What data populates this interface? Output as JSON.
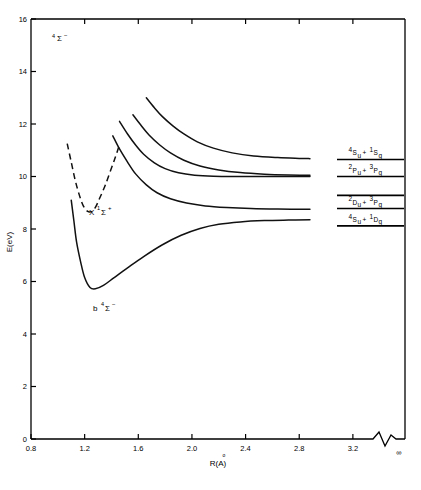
{
  "figure": {
    "state_label": "4Σ−",
    "state_label_sup": "4",
    "state_label_main": "Σ",
    "state_label_charge": "−"
  },
  "axes": {
    "y_title": "E(eV)",
    "x_title_main": "R(A)",
    "x_title_ring": "o",
    "x_title_display": "R(Å)",
    "y_ticks": [
      "0",
      "2",
      "4",
      "6",
      "8",
      "10",
      "12",
      "14",
      "16"
    ],
    "y_values": [
      0,
      2,
      4,
      6,
      8,
      10,
      12,
      14,
      16
    ],
    "x_ticks": [
      "0.8",
      "1.2",
      "1.6",
      "2.0",
      "2.4",
      "2.8",
      "3.2"
    ],
    "x_values": [
      0.8,
      1.2,
      1.6,
      2.0,
      2.4,
      2.8,
      3.2
    ],
    "x_infinity": "∞",
    "ylim": [
      0,
      16
    ],
    "xlim": [
      0.8,
      3.35
    ],
    "grid": false,
    "break_present": true
  },
  "curve_labels": {
    "ground": {
      "prefix": "X",
      "sup": "1",
      "term": "Σ",
      "charge": "+",
      "full": "X 1Σ+"
    },
    "quartet": {
      "prefix": "b",
      "sup": "4",
      "term": "Σ",
      "charge": "−",
      "full": "b 4Σ−"
    }
  },
  "dissociation_limits": [
    {
      "id": "limit-1",
      "energy": 10.65,
      "left": "4",
      "left_term": "S",
      "left_sub": "u",
      "right": "1",
      "right_term": "S",
      "right_sub": "g",
      "text": "4Su + 1Sg"
    },
    {
      "id": "limit-2",
      "energy": 10.0,
      "left": "2",
      "left_term": "P",
      "left_sub": "u",
      "right": "3",
      "right_term": "P",
      "right_sub": "g",
      "text": "2Pu + 3Pg"
    },
    {
      "id": "limit-3",
      "energy": 9.28,
      "left": "",
      "left_term": "",
      "left_sub": "",
      "right": "",
      "right_term": "",
      "right_sub": "",
      "text": ""
    },
    {
      "id": "limit-4",
      "energy": 8.78,
      "left": "2",
      "left_term": "D",
      "left_sub": "u",
      "right": "3",
      "right_term": "P",
      "right_sub": "g",
      "text": "2Du + 3Pg"
    },
    {
      "id": "limit-5",
      "energy": 8.12,
      "left": "4",
      "left_term": "S",
      "left_sub": "u",
      "right": "1",
      "right_term": "D",
      "right_sub": "g",
      "text": "4Su + 1Dg"
    }
  ],
  "chart_data": {
    "type": "line",
    "title": "",
    "xlabel": "R(Å)",
    "ylabel": "E(eV)",
    "xlim": [
      0.8,
      3.35
    ],
    "ylim": [
      0,
      16
    ],
    "grid": false,
    "legend": "none",
    "series": [
      {
        "name": "X 1Σ+",
        "style": "dashed",
        "label": "X 1Σ+",
        "points": [
          [
            1.07,
            11.25
          ],
          [
            1.1,
            10.55
          ],
          [
            1.13,
            9.85
          ],
          [
            1.16,
            9.3
          ],
          [
            1.19,
            8.88
          ],
          [
            1.22,
            8.68
          ],
          [
            1.25,
            8.66
          ],
          [
            1.28,
            8.82
          ],
          [
            1.31,
            9.15
          ],
          [
            1.35,
            9.62
          ],
          [
            1.39,
            10.18
          ],
          [
            1.43,
            10.75
          ],
          [
            1.46,
            11.22
          ]
        ]
      },
      {
        "name": "b 4Σ−",
        "style": "solid",
        "label": "b 4Σ−",
        "points": [
          [
            1.1,
            9.1
          ],
          [
            1.12,
            8.3
          ],
          [
            1.14,
            7.5
          ],
          [
            1.17,
            6.75
          ],
          [
            1.2,
            6.15
          ],
          [
            1.24,
            5.77
          ],
          [
            1.28,
            5.72
          ],
          [
            1.34,
            5.85
          ],
          [
            1.42,
            6.15
          ],
          [
            1.52,
            6.52
          ],
          [
            1.64,
            6.95
          ],
          [
            1.78,
            7.4
          ],
          [
            1.92,
            7.76
          ],
          [
            2.06,
            8.02
          ],
          [
            2.2,
            8.18
          ],
          [
            2.36,
            8.27
          ],
          [
            2.54,
            8.32
          ],
          [
            2.72,
            8.34
          ],
          [
            2.88,
            8.35
          ]
        ]
      },
      {
        "name": "repulsive-1",
        "style": "solid",
        "asymptote": 8.75,
        "points": [
          [
            1.41,
            11.55
          ],
          [
            1.46,
            11.05
          ],
          [
            1.52,
            10.55
          ],
          [
            1.58,
            10.1
          ],
          [
            1.66,
            9.68
          ],
          [
            1.74,
            9.38
          ],
          [
            1.84,
            9.15
          ],
          [
            1.96,
            8.99
          ],
          [
            2.1,
            8.88
          ],
          [
            2.26,
            8.82
          ],
          [
            2.44,
            8.78
          ],
          [
            2.64,
            8.76
          ],
          [
            2.88,
            8.75
          ]
        ]
      },
      {
        "name": "repulsive-2",
        "style": "solid",
        "asymptote": 10.0,
        "points": [
          [
            1.46,
            12.1
          ],
          [
            1.52,
            11.62
          ],
          [
            1.58,
            11.2
          ],
          [
            1.64,
            10.85
          ],
          [
            1.72,
            10.52
          ],
          [
            1.8,
            10.3
          ],
          [
            1.9,
            10.14
          ],
          [
            2.02,
            10.05
          ],
          [
            2.16,
            10.01
          ],
          [
            2.34,
            10.0
          ],
          [
            2.54,
            10.0
          ],
          [
            2.74,
            10.0
          ],
          [
            2.88,
            10.0
          ]
        ]
      },
      {
        "name": "repulsive-3",
        "style": "solid",
        "asymptote": 10.05,
        "points": [
          [
            1.56,
            12.35
          ],
          [
            1.62,
            11.95
          ],
          [
            1.68,
            11.58
          ],
          [
            1.76,
            11.2
          ],
          [
            1.84,
            10.9
          ],
          [
            1.94,
            10.62
          ],
          [
            2.06,
            10.4
          ],
          [
            2.2,
            10.25
          ],
          [
            2.36,
            10.15
          ],
          [
            2.54,
            10.09
          ],
          [
            2.72,
            10.06
          ],
          [
            2.88,
            10.05
          ]
        ]
      },
      {
        "name": "repulsive-4",
        "style": "solid",
        "asymptote": 10.68,
        "points": [
          [
            1.66,
            13.0
          ],
          [
            1.72,
            12.62
          ],
          [
            1.78,
            12.28
          ],
          [
            1.86,
            11.92
          ],
          [
            1.94,
            11.62
          ],
          [
            2.04,
            11.32
          ],
          [
            2.16,
            11.08
          ],
          [
            2.3,
            10.9
          ],
          [
            2.46,
            10.78
          ],
          [
            2.64,
            10.72
          ],
          [
            2.8,
            10.69
          ],
          [
            2.88,
            10.68
          ]
        ]
      }
    ],
    "dissociation_levels": [
      {
        "label": "4Su + 1Sg",
        "energy": 10.65
      },
      {
        "label": "2Pu + 3Pg",
        "energy": 10.0
      },
      {
        "label": "",
        "energy": 9.28
      },
      {
        "label": "2Du + 3Pg",
        "energy": 8.78
      },
      {
        "label": "4Su + 1Dg",
        "energy": 8.12
      }
    ]
  }
}
